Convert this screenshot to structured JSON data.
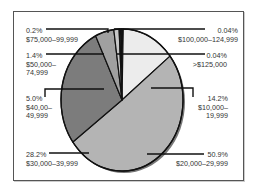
{
  "chart_data": {
    "type": "pie",
    "title": "",
    "slices": [
      {
        "pct_label": "0.04%",
        "range_label": "$100,000–124,999",
        "value": 0.04,
        "color": "#111111"
      },
      {
        "pct_label": "0.04%",
        "range_label": ">$125,000",
        "value": 0.04,
        "color": "#111111"
      },
      {
        "pct_label": "14.2%",
        "range_label": "$10,000–19,999",
        "value": 14.2,
        "color": "#ececec"
      },
      {
        "pct_label": "50.9%",
        "range_label": "$20,000–29,999",
        "value": 50.9,
        "color": "#b4b4b4"
      },
      {
        "pct_label": "28.2%",
        "range_label": "$30,000–39,999",
        "value": 28.2,
        "color": "#7c7c7c"
      },
      {
        "pct_label": "5.0%",
        "range_label": "$40,00–49,999",
        "value": 5.0,
        "color": "#a0a0a0"
      },
      {
        "pct_label": "1.4%",
        "range_label": "$50,000–74,999",
        "value": 1.4,
        "color": "#c8c8c8"
      },
      {
        "pct_label": "0.2%",
        "range_label": "$75,000–99,999",
        "value": 0.2,
        "color": "#e0e0e0"
      }
    ],
    "legend": "none",
    "labels": [
      {
        "id": "l-75k",
        "line1": "0.2%",
        "line2": "$75,000–99,999",
        "line3": ""
      },
      {
        "id": "l-50k",
        "line1": "1.4%",
        "line2": "$50,000–",
        "line3": "74,999"
      },
      {
        "id": "l-40k",
        "line1": "5.0%",
        "line2": "$40,00–",
        "line3": "49,999"
      },
      {
        "id": "l-30k",
        "line1": "28.2%",
        "line2": "$30,000–39,999",
        "line3": ""
      },
      {
        "id": "l-100k",
        "line1": "0.04%",
        "line2": "$100,000–124,999",
        "line3": ""
      },
      {
        "id": "l-125k",
        "line1": "0.04%",
        "line2": ">$125,000",
        "line3": ""
      },
      {
        "id": "l-10k",
        "line1": "14.2%",
        "line2": "$10,000–",
        "line3": "19,999"
      },
      {
        "id": "l-20k",
        "line1": "50.9%",
        "line2": "$20,000–29,999",
        "line3": ""
      }
    ]
  }
}
